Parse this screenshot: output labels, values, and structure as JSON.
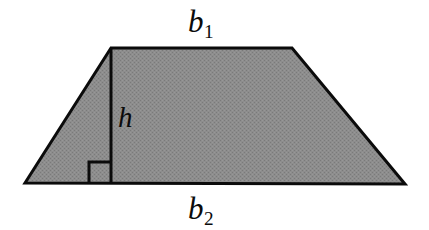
{
  "figure": {
    "kind": "geometry-diagram",
    "shape_name": "trapezoid",
    "width": 429,
    "height": 230,
    "background_color": "#ffffff",
    "fill_color": "#8a8a8a",
    "stroke_color": "#0b0b0b",
    "stroke_width": 3,
    "labels": {
      "top_base": "b",
      "top_base_subscript": "1",
      "bottom_base": "b",
      "bottom_base_subscript": "2",
      "height": "h"
    },
    "geometry": {
      "vertices": {
        "top_left": [
          111,
          48
        ],
        "top_right": [
          292,
          48
        ],
        "bottom_right": [
          405,
          184
        ],
        "bottom_left": [
          25,
          183
        ]
      },
      "height_line": {
        "from": [
          111,
          48
        ],
        "to": [
          111,
          184
        ]
      },
      "right_angle_marker": {
        "size": 22,
        "corner": [
          111,
          184
        ],
        "opens": "left"
      }
    }
  }
}
